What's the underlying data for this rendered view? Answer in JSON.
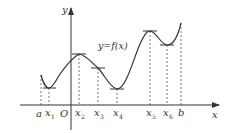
{
  "diagram": {
    "type": "function-graph",
    "function_label": "y=f(x)",
    "axes": {
      "x_label": "x",
      "y_label": "y",
      "origin_label": "O"
    },
    "x_ticks": [
      {
        "id": "a",
        "label": "a",
        "sub": ""
      },
      {
        "id": "x1",
        "label": "x",
        "sub": "1"
      },
      {
        "id": "x2",
        "label": "x",
        "sub": "2"
      },
      {
        "id": "x3",
        "label": "x",
        "sub": "3"
      },
      {
        "id": "x4",
        "label": "x",
        "sub": "4"
      },
      {
        "id": "x5",
        "label": "x",
        "sub": "5"
      },
      {
        "id": "x6",
        "label": "x",
        "sub": "6"
      },
      {
        "id": "b",
        "label": "b",
        "sub": ""
      }
    ],
    "tangent_points": [
      "x1",
      "x2",
      "x3",
      "x4",
      "x5",
      "x6"
    ],
    "extrema": {
      "local_min": [
        "x1",
        "x4",
        "x6"
      ],
      "local_max": [
        "x2",
        "x5"
      ],
      "horizontal_tangent_non_extremum": [
        "x3"
      ]
    },
    "colors": {
      "line": "#333333",
      "background": "#ffffff"
    }
  }
}
